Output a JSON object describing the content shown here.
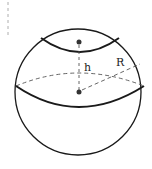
{
  "diagram": {
    "labels": {
      "height": "h",
      "radius": "R"
    },
    "colors": {
      "stroke": "#1a1a1a",
      "dashed": "#555555",
      "background": "#ffffff"
    }
  }
}
